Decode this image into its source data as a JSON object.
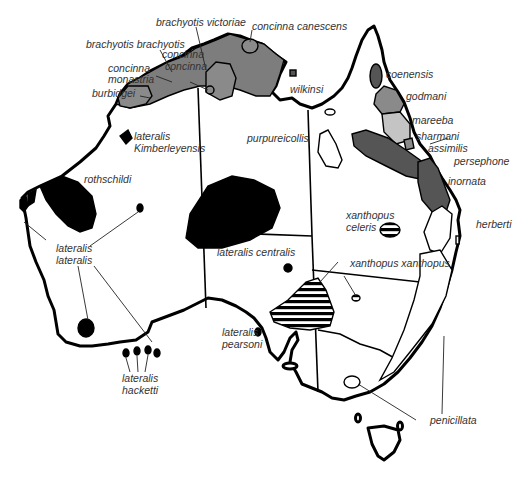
{
  "map": {
    "title": "Distribution of rock-wallaby taxa in Australia",
    "colors": {
      "dark_gray": "#555555",
      "mid_gray": "#808080",
      "light_gray": "#c4c4c4",
      "black": "#000000",
      "hatch": "#000000",
      "outline": "#000000",
      "background": "#ffffff"
    },
    "labels": {
      "brachyotis_victoriae": "brachyotis victoriae",
      "concinna_canescens": "concinna canescens",
      "brachyotis_brachyotis": "brachyotis brachyotis",
      "concinna_concinna_1": "concinna",
      "concinna_concinna_2": "concinna",
      "concinna_monastria_1": "concinna",
      "concinna_monastria_2": "monastria",
      "burbidgei": "burbidgei",
      "wilkinsi": "wilkinsi",
      "coenensis": "coenensis",
      "godmani": "godmani",
      "mareeba": "mareeba",
      "sharmani": "sharmani",
      "assimilis": "assimilis",
      "persephone": "persephone",
      "inornata": "inornata",
      "herberti": "herberti",
      "lateralis_kimberleyensis_1": "lateralis",
      "lateralis_kimberleyensis_2": "Kimberleyensis",
      "purpureicollis": "purpureicollis",
      "rothschildi": "rothschildi",
      "lateralis_lateralis_1": "lateralis",
      "lateralis_lateralis_2": "lateralis",
      "xanthopus_celeris_1": "xanthopus",
      "xanthopus_celeris_2": "celeris",
      "lateralis_centralis": "lateralis centralis",
      "xanthopus_xanthopus": "xanthopus xanthopus",
      "lateralis_pearsoni_1": "lateralis",
      "lateralis_pearsoni_2": "pearsoni",
      "lateralis_hacketti_1": "lateralis",
      "lateralis_hacketti_2": "hacketti",
      "penicillata": "penicillata"
    }
  }
}
